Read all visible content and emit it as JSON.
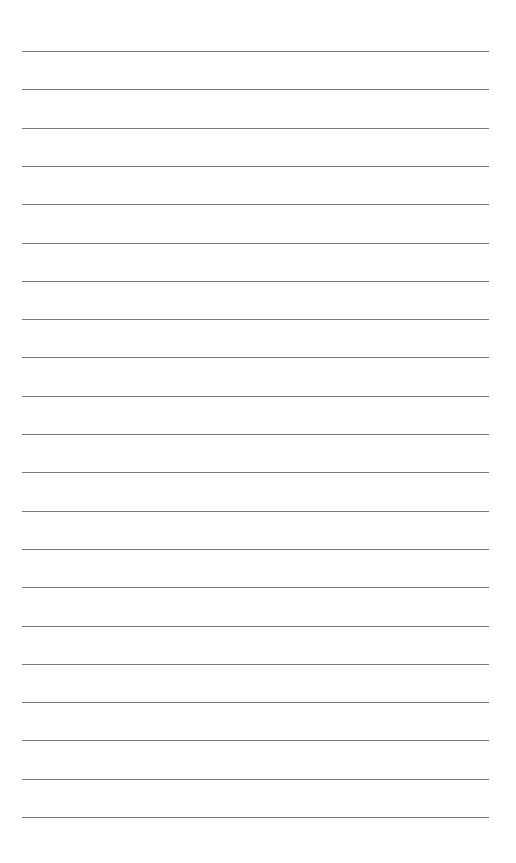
{
  "page": {
    "type": "lined-paper",
    "background": "#ffffff",
    "line_color": "#7a7a7a",
    "line_count": 21,
    "first_line_y": 51,
    "line_spacing": 38.3,
    "line_left": 22,
    "line_width": 467
  }
}
